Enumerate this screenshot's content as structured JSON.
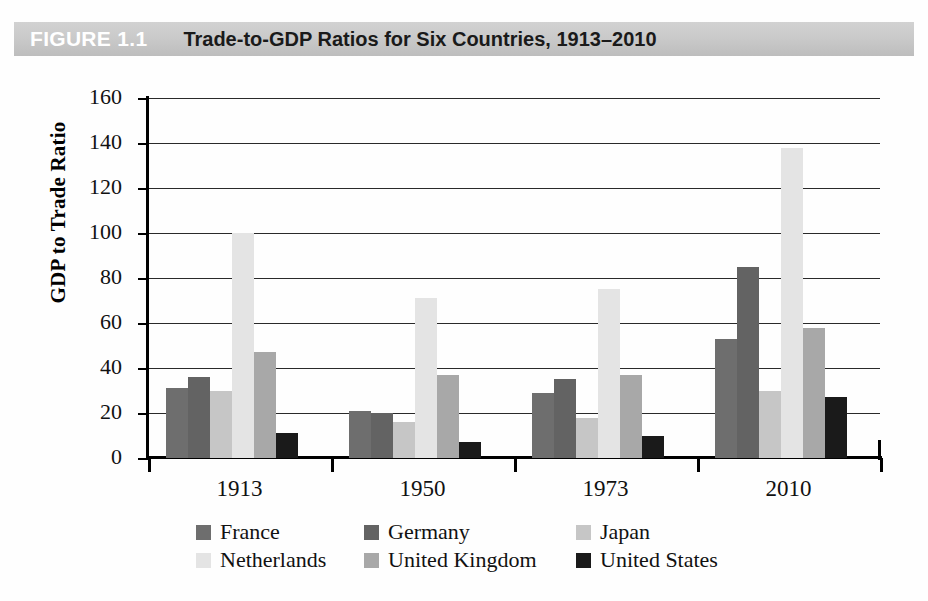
{
  "header": {
    "figure_tag": "FIGURE 1.1",
    "title": "Trade-to-GDP Ratios for Six Countries, 1913–2010",
    "band_color": "#c9c9c9",
    "tag_color": "#ffffff",
    "title_color": "#1a1a1a"
  },
  "chart_data": {
    "type": "bar",
    "title": "Trade-to-GDP Ratios for Six Countries, 1913–2010",
    "xlabel": "",
    "ylabel": "GDP to Trade Ratio",
    "categories": [
      "1913",
      "1950",
      "1973",
      "2010"
    ],
    "yticks": [
      0,
      20,
      40,
      60,
      80,
      100,
      120,
      140,
      160
    ],
    "ylim": [
      0,
      160
    ],
    "grid": true,
    "legend_position": "bottom",
    "series": [
      {
        "name": "France",
        "color": "#6e6e6e",
        "values": [
          31,
          21,
          29,
          53
        ]
      },
      {
        "name": "Germany",
        "color": "#636363",
        "values": [
          36,
          20,
          35,
          85
        ]
      },
      {
        "name": "Japan",
        "color": "#c6c6c6",
        "values": [
          30,
          16,
          18,
          30
        ]
      },
      {
        "name": "Netherlands",
        "color": "#e4e4e4",
        "values": [
          100,
          71,
          75,
          138
        ]
      },
      {
        "name": "United Kingdom",
        "color": "#a8a8a8",
        "values": [
          47,
          37,
          37,
          58
        ]
      },
      {
        "name": "United States",
        "color": "#1a1a1a",
        "values": [
          11,
          7,
          10,
          27
        ]
      }
    ]
  },
  "legend": {
    "items": [
      {
        "label": "France",
        "color": "#6e6e6e"
      },
      {
        "label": "Germany",
        "color": "#636363"
      },
      {
        "label": "Japan",
        "color": "#c6c6c6"
      },
      {
        "label": "Netherlands",
        "color": "#e4e4e4"
      },
      {
        "label": "United Kingdom",
        "color": "#a8a8a8"
      },
      {
        "label": "United States",
        "color": "#1a1a1a"
      }
    ]
  }
}
